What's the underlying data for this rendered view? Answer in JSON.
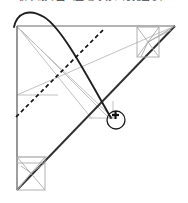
{
  "figure": {
    "title_clipped": "折り紙の図（上端で切れた見出し）",
    "kind": "geometric-construction-diagram",
    "background_color": "#ffffff",
    "ink_color": "#262626",
    "construction_color": "#b9b9b9",
    "dashed_color": "#1d1d1d",
    "canvas": {
      "width": 188,
      "height": 203
    }
  },
  "elements": {
    "main_triangle": {
      "name": "right-triangle",
      "vertices": [
        [
          17,
          26
        ],
        [
          175,
          26
        ],
        [
          17,
          190
        ]
      ],
      "stroke": "#555555",
      "stroke_width": 1.1
    },
    "hypotenuse": {
      "name": "hypotenuse",
      "from": [
        175,
        26
      ],
      "to": [
        17,
        190
      ],
      "stroke": "#2b2b2b",
      "stroke_width": 1.8
    },
    "arc_curve": {
      "name": "fold-arc",
      "start": [
        14,
        26
      ],
      "peak": [
        35,
        11
      ],
      "end": [
        110,
        118
      ],
      "stroke": "#1f1f1f",
      "stroke_width": 1.8
    },
    "dashed_line": {
      "name": "crease-dashed-line",
      "from": [
        17,
        116
      ],
      "to": [
        104,
        29
      ],
      "dash": "4 3",
      "stroke": "#171717",
      "stroke_width": 1.6
    },
    "gray_lines": [
      {
        "name": "gray-diagonal-upper-left",
        "from": [
          17,
          26
        ],
        "to": [
          112,
          116
        ]
      },
      {
        "name": "gray-long-diagonal",
        "from": [
          17,
          95
        ],
        "to": [
          175,
          26
        ]
      },
      {
        "name": "gray-edge-to-marker",
        "from": [
          20,
          29
        ],
        "to": [
          110,
          118
        ]
      },
      {
        "name": "gray-horizontal-mid",
        "from": [
          17,
          95
        ],
        "to": [
          57,
          95
        ]
      },
      {
        "name": "gray-marker-base",
        "from": [
          89,
          118
        ],
        "to": [
          113,
          118
        ]
      },
      {
        "name": "gray-marker-vertical",
        "from": [
          113,
          101
        ],
        "to": [
          113,
          119
        ]
      }
    ],
    "corner_square_top_right": {
      "name": "corner-square-top-right",
      "rect": [
        137,
        27,
        22,
        30
      ],
      "diagonals": true,
      "stroke": "#a9a9a9"
    },
    "corner_square_bottom_left": {
      "name": "corner-square-bottom-left",
      "rect": [
        17,
        157,
        28,
        33
      ],
      "diagonals": true,
      "stroke": "#a9a9a9"
    },
    "cursor_marker": {
      "name": "cursor-crosshair-marker",
      "center": [
        115,
        119
      ],
      "circle_radius": 9,
      "circle_stroke": "#1a1a1a",
      "crosshair_color": "#111111",
      "crosshair_size": 8
    }
  }
}
